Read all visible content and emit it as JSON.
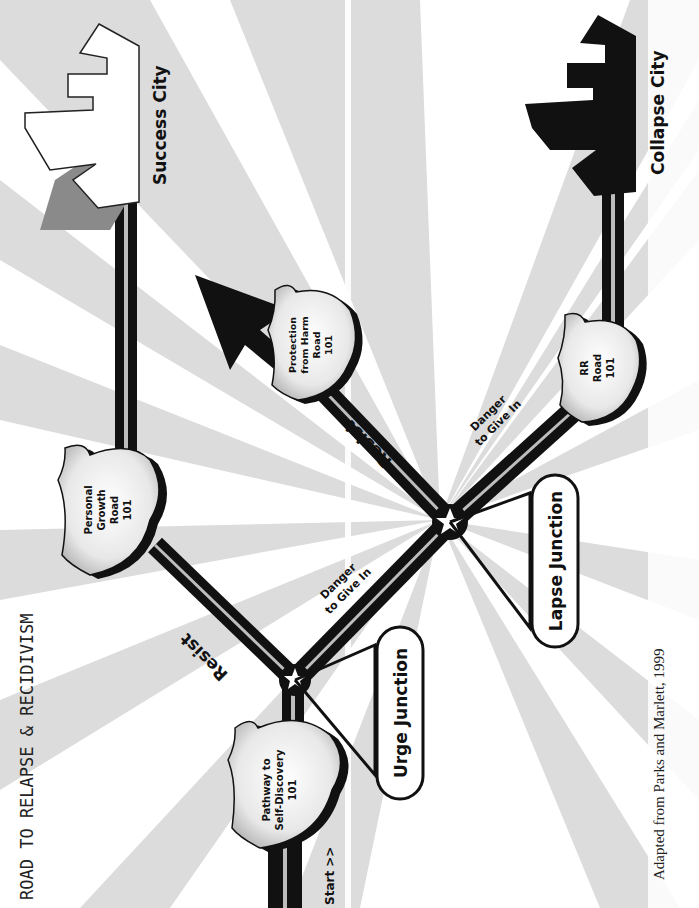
{
  "title": "ROAD TO RELAPSE & RECIDIVISM",
  "citation": "Adapted from Parks and Marlett, 1999",
  "start_label": "Start >>",
  "destinations": {
    "success": "Success City",
    "collapse": "Collapse City"
  },
  "shields": [
    {
      "id": "self-discovery",
      "lines": [
        "Pathway to",
        "Self-Discovery",
        "101"
      ]
    },
    {
      "id": "personal-growth",
      "lines": [
        "Personal",
        "Growth",
        "Road",
        "101"
      ]
    },
    {
      "id": "protection",
      "lines": [
        "Protection",
        "from Harm",
        "Road",
        "101"
      ]
    },
    {
      "id": "rr",
      "lines": [
        "RR",
        "Road",
        "101"
      ]
    }
  ],
  "junctions": {
    "urge": "Urge Junction",
    "lapse": "Lapse Junction"
  },
  "road_labels": {
    "resist_1": "Resist",
    "resist_2": "Resist",
    "danger_1": [
      "Danger",
      "to Give In"
    ],
    "danger_2": [
      "Danger",
      "to Give In"
    ]
  },
  "colors": {
    "ray_gray": "#dcdcdc",
    "road": "#111111",
    "road_stripe": "#bdbdbd",
    "success_city": "#ffffff",
    "success_shadow": "#8a8a8a",
    "collapse_city": "#111111",
    "background": "#ffffff"
  }
}
